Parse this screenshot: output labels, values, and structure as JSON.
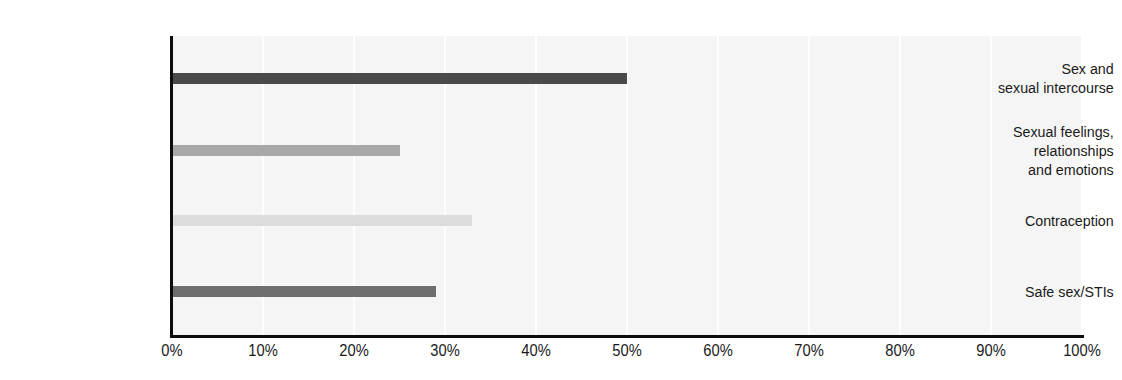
{
  "chart": {
    "title": "",
    "title_visible_fragment": "",
    "background": "#ffffff",
    "plot_background": "#f5f5f5",
    "axis_color": "#0d0d0d",
    "gridline_color": "#ffffff"
  },
  "chart_data": {
    "type": "bar",
    "orientation": "horizontal",
    "title": "",
    "xlabel": "",
    "ylabel": "",
    "xlim": [
      0,
      100
    ],
    "grid": true,
    "legend": "none",
    "xticks": [
      "0%",
      "10%",
      "20%",
      "30%",
      "40%",
      "50%",
      "60%",
      "70%",
      "80%",
      "90%",
      "100%"
    ],
    "xtick_values": [
      0,
      10,
      20,
      30,
      40,
      50,
      60,
      70,
      80,
      90,
      100
    ],
    "categories": [
      "Sex and\nsexual intercourse",
      "Sexual feelings,\nrelationships\nand emotions",
      "Contraception",
      "Safe sex/STIs"
    ],
    "values": [
      50,
      25,
      33,
      29
    ],
    "value_labels": [
      "50%",
      "25%",
      "33%",
      "29%"
    ],
    "bar_colors": [
      "#4a4a4a",
      "#a8a8a8",
      "#dcdcdc",
      "#6e6e6e"
    ],
    "unit": "%"
  }
}
